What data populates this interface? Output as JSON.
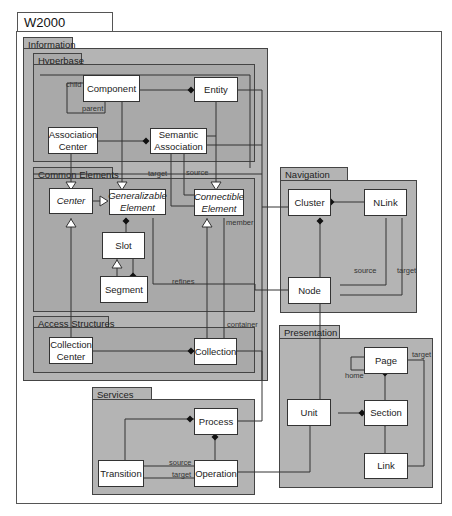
{
  "diagram": {
    "title": "W2000 Elements",
    "colors": {
      "package_fill": "#b4b4b4",
      "inner_package_fill": "#a9a9a9",
      "class_fill": "#ffffff",
      "line": "#333333"
    },
    "packages": {
      "information": {
        "label": "Information"
      },
      "hyperbase": {
        "label": "Hyperbase"
      },
      "common_elements": {
        "label": "Common Elements"
      },
      "access_structures": {
        "label": "Access Structures"
      },
      "navigation": {
        "label": "Navigation"
      },
      "presentation": {
        "label": "Presentation"
      },
      "services": {
        "label": "Services"
      }
    },
    "classes": {
      "component": "Component",
      "entity": "Entity",
      "association_center": "Association Center",
      "semantic_association": "Semantic Association",
      "center": "Center",
      "generalizable_element": "Generalizable Element",
      "connectible_element": "Connectible Element",
      "slot": "Slot",
      "segment": "Segment",
      "collection_center": "Collection Center",
      "collection": "Collection",
      "cluster": "Cluster",
      "nlink": "NLink",
      "node": "Node",
      "page": "Page",
      "unit": "Unit",
      "section": "Section",
      "link": "Link",
      "process": "Process",
      "transition": "Transition",
      "operation": "Operation"
    },
    "roles": {
      "child": "child",
      "parent": "parent",
      "target_sa": "target",
      "source_sa": "source",
      "member": "member",
      "refines": "refines",
      "container": "container",
      "source_nlink": "source",
      "target_nlink": "target",
      "home": "home",
      "target_link": "target",
      "source_trans": "source",
      "target_trans": "target"
    }
  }
}
